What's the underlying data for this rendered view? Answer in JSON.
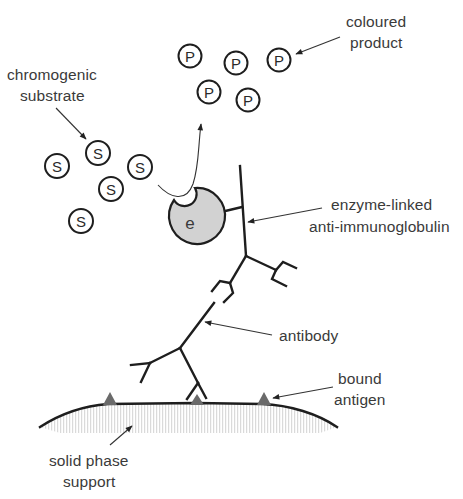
{
  "colors": {
    "line": "#1e1e1e",
    "label_text": "#3a3a3a",
    "enzyme_fill": "#d2d2d2",
    "antigen_fill": "#6a6a6a",
    "support_hatch": "#d8d8d8",
    "background": "#ffffff"
  },
  "labels": {
    "chromogenic_substrate": [
      "chromogenic",
      "substrate"
    ],
    "coloured_product": [
      "coloured",
      "product"
    ],
    "enzyme_linked": [
      "enzyme-linked",
      "anti-immunoglobulin"
    ],
    "antibody": [
      "antibody"
    ],
    "bound_antigen": [
      "bound",
      "antigen"
    ],
    "solid_phase_support": [
      "solid phase",
      "support"
    ]
  },
  "substrate_molecules": {
    "symbol": "S",
    "count": 5,
    "items": [
      {
        "x": 57,
        "y": 166
      },
      {
        "x": 98,
        "y": 153
      },
      {
        "x": 140,
        "y": 167
      },
      {
        "x": 111,
        "y": 189
      },
      {
        "x": 81,
        "y": 221
      }
    ]
  },
  "product_molecules": {
    "symbol": "P",
    "count": 5,
    "items": [
      {
        "x": 190,
        "y": 56
      },
      {
        "x": 236,
        "y": 63
      },
      {
        "x": 279,
        "y": 60
      },
      {
        "x": 209,
        "y": 92
      },
      {
        "x": 248,
        "y": 100
      }
    ]
  },
  "enzyme": {
    "symbol": "e"
  },
  "antigens": {
    "count": 3
  }
}
